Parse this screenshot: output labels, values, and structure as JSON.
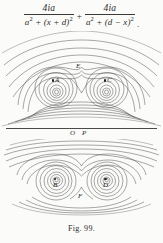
{
  "formula": {
    "term1": {
      "numerator": "4ia",
      "denominator_base": "a",
      "denominator_exp": "2",
      "denominator_rest": " + (x + d)",
      "denominator_rest_exp": "2"
    },
    "operator": "+",
    "term2": {
      "numerator": "4ia",
      "denominator_base": "a",
      "denominator_exp": "2",
      "denominator_rest": " + (d − x)",
      "denominator_rest_exp": "2"
    },
    "end_punctuation": ".",
    "plain_text": "4ia/(a² + (x + d)²) + 4ia/(a² + (d − x)²)."
  },
  "axis": {
    "label_origin": "O",
    "label_point": "P"
  },
  "upper_diagram": {
    "description": "stream-line field pattern with two vortex centres and a saddle point",
    "points": [
      {
        "id": "A",
        "label": "A",
        "role": "vortex-centre-left"
      },
      {
        "id": "C",
        "label": "C",
        "role": "vortex-centre-right"
      },
      {
        "id": "E",
        "label": "E",
        "role": "saddle-point"
      }
    ]
  },
  "lower_diagram": {
    "description": "mirrored stream-line field pattern with two vortex centres and a saddle point",
    "points": [
      {
        "id": "B",
        "label": "B",
        "role": "vortex-centre-left"
      },
      {
        "id": "D",
        "label": "D",
        "role": "vortex-centre-right"
      },
      {
        "id": "F",
        "label": "F",
        "role": "saddle-point"
      }
    ]
  },
  "caption": "Fig. 99.",
  "colors": {
    "ink": "#2b2b2b",
    "line": "#3c3c3c",
    "paper": "#fbfbf9"
  }
}
